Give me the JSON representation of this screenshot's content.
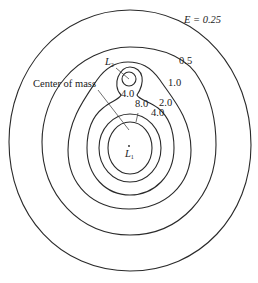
{
  "diagram": {
    "type": "contour-plot",
    "contour_labels": {
      "e025": "E = 0.25",
      "e05": "0.5",
      "e10": "1.0",
      "e20": "2.0",
      "e40_outer": "4.0",
      "e40_inner": "4.0",
      "e80": "8.0"
    },
    "points": {
      "l1": {
        "symbol": "L",
        "subscript": "1"
      },
      "l2": {
        "symbol": "L",
        "subscript": "2"
      }
    },
    "annotations": {
      "center_of_mass": "Center of mass"
    },
    "colors": {
      "line": "#2a2a2a",
      "background": "#ffffff"
    }
  }
}
